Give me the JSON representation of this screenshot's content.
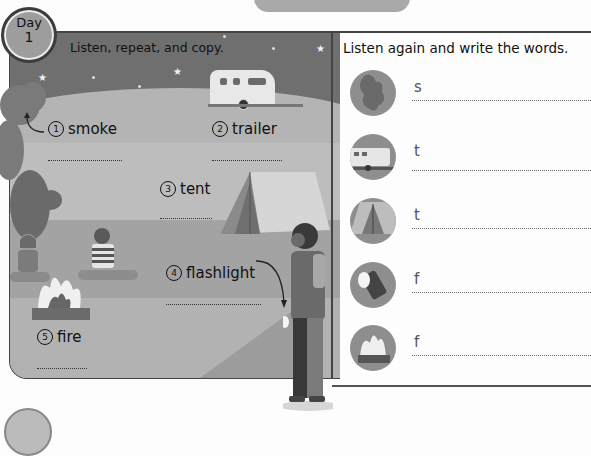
{
  "header": {
    "day_label": "Day",
    "day_number": "1",
    "left_instruction": "Listen, repeat, and copy.",
    "right_instruction": "Listen again and write the words."
  },
  "scene": {
    "items": [
      {
        "number": "1",
        "word": "smoke"
      },
      {
        "number": "2",
        "word": "trailer"
      },
      {
        "number": "3",
        "word": "tent"
      },
      {
        "number": "4",
        "word": "flashlight"
      },
      {
        "number": "5",
        "word": "fire"
      }
    ]
  },
  "write_exercise": {
    "rows": [
      {
        "picture": "smoke-icon",
        "first_letter": "s"
      },
      {
        "picture": "trailer-icon",
        "first_letter": "t"
      },
      {
        "picture": "tent-icon",
        "first_letter": "t"
      },
      {
        "picture": "flashlight-icon",
        "first_letter": "f"
      },
      {
        "picture": "fire-icon",
        "first_letter": "f"
      }
    ]
  },
  "colors": {
    "border": "#444444",
    "sky": "#6f6f6f",
    "ground": "#b4b4b4",
    "text": "#111111"
  }
}
